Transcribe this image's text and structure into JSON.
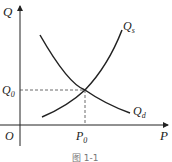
{
  "diagram": {
    "type": "supply-demand-curve",
    "axes": {
      "y_label": "Q",
      "x_label": "P",
      "origin_label": "O"
    },
    "curves": [
      {
        "name": "supply",
        "label": "Q",
        "subscript": "s"
      },
      {
        "name": "demand",
        "label": "Q",
        "subscript": "d"
      }
    ],
    "equilibrium": {
      "q_label": "Q",
      "q_subscript": "0",
      "p_label": "P",
      "p_subscript": "0"
    },
    "caption": "图 1-1",
    "colors": {
      "line": "#222222",
      "dashed": "#444444",
      "background": "#ffffff"
    }
  }
}
